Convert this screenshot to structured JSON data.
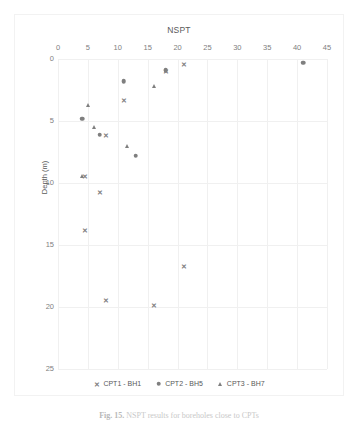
{
  "chart_data": {
    "type": "scatter",
    "title": "NSPT",
    "xlabel": "NSPT",
    "ylabel": "Depth (m)",
    "xlim": [
      0,
      45
    ],
    "ylim": [
      25,
      0
    ],
    "y_inverted": true,
    "grid": true,
    "legend_position": "bottom",
    "xticks": [
      0,
      5,
      10,
      15,
      20,
      25,
      30,
      35,
      40,
      45
    ],
    "yticks": [
      0,
      5,
      10,
      15,
      20,
      25
    ],
    "marker_color": "#7f7f7f",
    "series": [
      {
        "name": "CPT1 - BH1",
        "marker": "x",
        "points": [
          {
            "x": 21,
            "y": 0.4
          },
          {
            "x": 18,
            "y": 1.0
          },
          {
            "x": 11,
            "y": 3.3
          },
          {
            "x": 8,
            "y": 6.1
          },
          {
            "x": 4.6,
            "y": 9.4
          },
          {
            "x": 7,
            "y": 10.7
          },
          {
            "x": 4.6,
            "y": 13.8
          },
          {
            "x": 21,
            "y": 16.7
          },
          {
            "x": 8,
            "y": 19.4
          },
          {
            "x": 16,
            "y": 19.8
          }
        ]
      },
      {
        "name": "CPT2 - BH5",
        "marker": "circle",
        "points": [
          {
            "x": 41,
            "y": 0.3
          },
          {
            "x": 18,
            "y": 0.9
          },
          {
            "x": 11,
            "y": 1.8
          },
          {
            "x": 4,
            "y": 4.8
          },
          {
            "x": 7,
            "y": 6.1
          },
          {
            "x": 13,
            "y": 7.8
          }
        ]
      },
      {
        "name": "CPT3 - BH7",
        "marker": "triangle",
        "points": [
          {
            "x": 16,
            "y": 2.2
          },
          {
            "x": 5,
            "y": 3.7
          },
          {
            "x": 6,
            "y": 5.5
          },
          {
            "x": 11.5,
            "y": 7.0
          },
          {
            "x": 4,
            "y": 9.4
          }
        ]
      }
    ]
  },
  "legend": [
    {
      "label": "CPT1 - BH1",
      "marker": "x"
    },
    {
      "label": "CPT2 - BH5",
      "marker": "circle"
    },
    {
      "label": "CPT3 - BH7",
      "marker": "triangle"
    }
  ],
  "caption": {
    "prefix": "Fig. 15.",
    "text": "NSPT results for boreholes close to CPTs"
  }
}
